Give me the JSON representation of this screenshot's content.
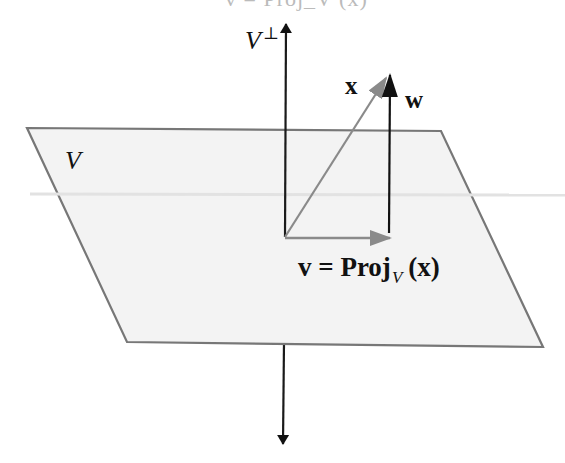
{
  "figure": {
    "clipped_top_text": "v = Proj_V (x)",
    "labels": {
      "v_perp": "V",
      "v_perp_sup": "⊥",
      "plane": "V",
      "x_vec": "x",
      "w_vec": "w",
      "v_eq_prefix": "v = Proj",
      "v_eq_sub": "V",
      "v_eq_suffix": "(x)"
    },
    "colors": {
      "plane_fill": "#f3f3f3",
      "plane_edge": "#777777",
      "axis": "#1a1a1a",
      "x_vector": "#8a8a8a",
      "v_vector": "#8a8a8a",
      "w_vector": "#111111"
    },
    "geometry": {
      "plane_corners": [
        [
          27,
          128
        ],
        [
          441,
          131
        ],
        [
          543,
          347
        ],
        [
          127,
          342
        ]
      ],
      "origin": [
        285,
        237
      ],
      "axis_top": [
        286,
        22
      ],
      "axis_bottom": [
        283,
        446
      ],
      "x_tip": [
        386,
        77
      ],
      "v_tip": [
        390,
        238
      ],
      "w_base": [
        389,
        233
      ],
      "w_tip": [
        390,
        74
      ]
    }
  }
}
